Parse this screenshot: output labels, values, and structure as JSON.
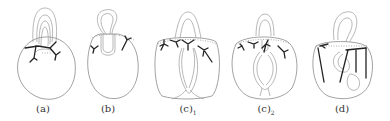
{
  "figure": {
    "panels": [
      {
        "id": "a",
        "label": "(a)",
        "sub": ""
      },
      {
        "id": "b",
        "label": "(b)",
        "sub": ""
      },
      {
        "id": "c1",
        "label": "(c)",
        "sub": "1"
      },
      {
        "id": "c2",
        "label": "(c)",
        "sub": "2"
      },
      {
        "id": "d",
        "label": "(d)",
        "sub": ""
      }
    ]
  },
  "colors": {
    "background": "#ffffff",
    "outline": "#8a8a8a",
    "strand": "#222222"
  }
}
